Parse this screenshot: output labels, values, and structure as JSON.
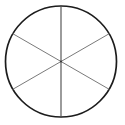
{
  "figure": {
    "name": "circle-divided-into-six-sectors",
    "background_color": "#ffffff",
    "width": 125,
    "height": 125,
    "labels": [],
    "text_visible": "none",
    "circle": {
      "center_x": 61,
      "center_y": 61.5,
      "radius": 55.5,
      "stroke_color": "#1c1c1c",
      "stroke_width": 1.7,
      "fill": "none"
    },
    "diameters": [
      {
        "name": "vertical-diameter",
        "angle_degrees": 90,
        "x1": 61,
        "y1": 6,
        "x2": 61,
        "y2": 117,
        "stroke_color": "#4a4a4a",
        "stroke_width": 1.1
      },
      {
        "name": "diagonal-diameter-up-right",
        "angle_degrees": 30,
        "x1": 12.9,
        "y1": 89.25,
        "x2": 109.1,
        "y2": 33.75,
        "stroke_color": "#7a7a7a",
        "stroke_width": 1.0
      },
      {
        "name": "diagonal-diameter-down-right",
        "angle_degrees": 150,
        "x1": 12.9,
        "y1": 33.75,
        "x2": 109.1,
        "y2": 89.25,
        "stroke_color": "#7a7a7a",
        "stroke_width": 1.0
      }
    ],
    "sectors": [
      {
        "name": "sector-1",
        "start_angle_degrees": 30,
        "end_angle_degrees": 90,
        "fill": "none"
      },
      {
        "name": "sector-2",
        "start_angle_degrees": 90,
        "end_angle_degrees": 150,
        "fill": "none"
      },
      {
        "name": "sector-3",
        "start_angle_degrees": 150,
        "end_angle_degrees": 210,
        "fill": "none"
      },
      {
        "name": "sector-4",
        "start_angle_degrees": 210,
        "end_angle_degrees": 270,
        "fill": "none"
      },
      {
        "name": "sector-5",
        "start_angle_degrees": 270,
        "end_angle_degrees": 330,
        "fill": "none"
      },
      {
        "name": "sector-6",
        "start_angle_degrees": 330,
        "end_angle_degrees": 390,
        "fill": "none"
      }
    ],
    "center_dot": {
      "name": "center-intersection-point",
      "x": 61,
      "y": 61.5,
      "radius": 1.0,
      "color": "#333333"
    }
  }
}
